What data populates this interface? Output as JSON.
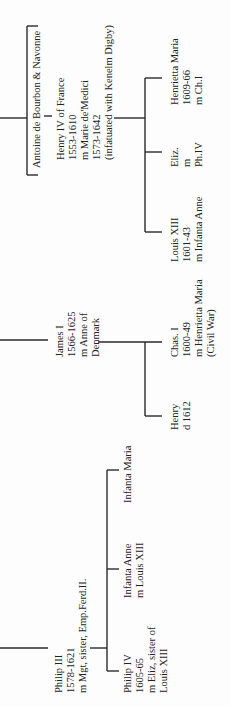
{
  "chart_title": "",
  "nodes": {
    "antoine": {
      "lines": [
        "Antoine de Bourbon & Navonne"
      ]
    },
    "henry_iv": {
      "lines": [
        "Henry IV of France",
        "1553-1610",
        "m Marie de'Medici",
        "1573-1642",
        "(infatuated with Kenelm Digby)"
      ]
    },
    "henrietta_maria": {
      "lines": [
        "Henrietta Maria",
        "1609-66",
        "m Ch.I"
      ]
    },
    "eliz": {
      "lines": [
        "Eliz.",
        "m",
        "Ph.IV"
      ]
    },
    "louis_xiii": {
      "lines": [
        "Louis XIII",
        "1601-43",
        "m Infanta Anne"
      ]
    },
    "james_i": {
      "lines": [
        "James I",
        "1566-1625",
        "m Anne of",
        "Denmark"
      ]
    },
    "chas_i": {
      "lines": [
        "Chas. I",
        "1600-49",
        "m Henrietta Maria",
        "(Civil War)"
      ]
    },
    "henry": {
      "lines": [
        "Henry",
        "d 1612"
      ]
    },
    "infanta_maria": {
      "lines": [
        "Infanta Maria"
      ]
    },
    "infanta_anne": {
      "lines": [
        "Infanta Anne",
        "m Louis XIII"
      ]
    },
    "philip_iii": {
      "lines": [
        "Philip III",
        "1578-1621",
        "m Mgt, sister, Emp.Ferd.II."
      ]
    },
    "philip_iv": {
      "lines": [
        "Philip IV",
        "1605-65",
        "m Eliz, sister of",
        "Louis XIII"
      ]
    }
  }
}
